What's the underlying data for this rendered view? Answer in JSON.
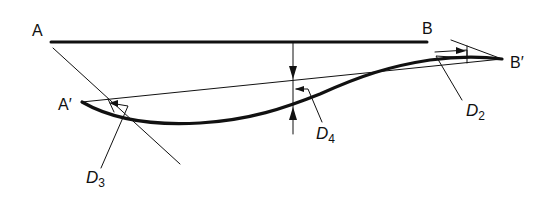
{
  "diagram": {
    "type": "beam-deflection",
    "colors": {
      "ink": "#111111",
      "background": "#ffffff"
    },
    "points": {
      "A": {
        "label": "A"
      },
      "B": {
        "label": "B"
      },
      "A_prime": {
        "label": "A′"
      },
      "B_prime": {
        "label": "B′"
      }
    },
    "dimensions": {
      "D2": {
        "letter": "D",
        "subscript": "2",
        "meaning": "rotation at B′ relative to chord"
      },
      "D3": {
        "letter": "D",
        "subscript": "3",
        "meaning": "rotation at A′ relative to chord"
      },
      "D4": {
        "letter": "D",
        "subscript": "4",
        "meaning": "deflection of curve from chord"
      }
    }
  }
}
